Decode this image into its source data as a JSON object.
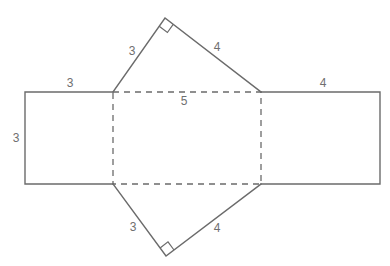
{
  "diagram": {
    "type": "net-of-triangular-prism",
    "colors": {
      "line": "#6b6b6b",
      "label": "#6f6f6f",
      "background": "#ffffff"
    },
    "labels": {
      "top_triangle_left_leg": "3",
      "top_triangle_right_leg": "4",
      "left_rect_top": "3",
      "left_rect_side": "3",
      "center_rect_top": "5",
      "right_rect_top": "4",
      "bottom_triangle_left_leg": "3",
      "bottom_triangle_right_leg": "4"
    },
    "right_angle_markers": [
      "top-triangle-apex",
      "bottom-triangle-apex"
    ]
  }
}
